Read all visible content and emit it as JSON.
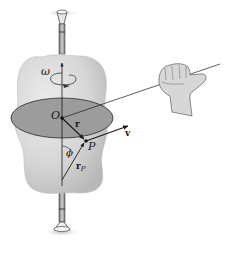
{
  "figure": {
    "labels": {
      "omega": "ω",
      "origin": "O",
      "r": "r",
      "point": "P",
      "velocity": "v",
      "angle": "ϕ",
      "rp_main": "r",
      "rp_sub": "P"
    },
    "colors": {
      "body_fill": "#d9d9d9",
      "body_shade": "#bdbdbd",
      "disk_fill": "#9a9a9a",
      "disk_edge": "#333333",
      "line": "#1a1a1a",
      "shaft": "#8c8c8c",
      "hand_fill": "#d4d4d4"
    }
  }
}
